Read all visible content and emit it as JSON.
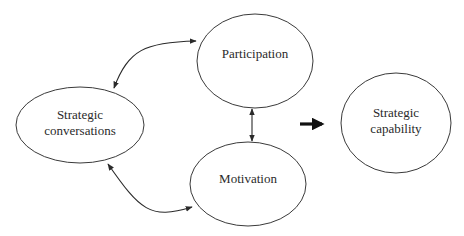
{
  "diagram": {
    "type": "flow",
    "nodes": [
      {
        "id": "strategic-conversations",
        "lines": [
          "Strategic",
          "conversations"
        ]
      },
      {
        "id": "participation",
        "lines": [
          "Participation"
        ]
      },
      {
        "id": "motivation",
        "lines": [
          "Motivation"
        ]
      },
      {
        "id": "strategic-capability",
        "lines": [
          "Strategic",
          "capability"
        ]
      }
    ],
    "edges": [
      {
        "from": "strategic-conversations",
        "to": "participation",
        "style": "curved",
        "bidirectional": true
      },
      {
        "from": "strategic-conversations",
        "to": "motivation",
        "style": "curved",
        "bidirectional": true
      },
      {
        "from": "participation",
        "to": "motivation",
        "style": "straight",
        "bidirectional": true
      },
      {
        "from": "participation+motivation",
        "to": "strategic-capability",
        "style": "thick",
        "bidirectional": false
      }
    ],
    "colors": {
      "stroke": "#3a3a3a",
      "text": "#2a2a2a",
      "background": "#ffffff"
    }
  }
}
